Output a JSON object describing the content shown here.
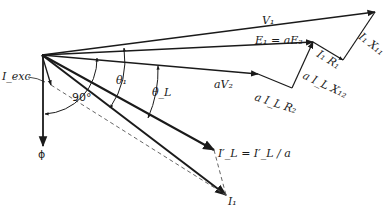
{
  "diagram": {
    "type": "phasor-diagram",
    "labels": {
      "v1": "V₁",
      "e1": "E₁ = aE₂",
      "av2": "aV₂",
      "i1r1": "I₁ R₁",
      "i1x1": "I₁ X₁₁",
      "ailr2": "a I_L R₂",
      "ailx2": "a I_L X₁₂",
      "theta1": "θ₁",
      "thetaL": "θ_L",
      "iexc": "I_exc",
      "deg90": "90°",
      "phi": "ϕ",
      "ilp": "I′_L = I′_L / a",
      "i1": "I₁"
    },
    "colors": {
      "line": "#1a1a1a",
      "dashed": "#555555",
      "background": "#ffffff"
    }
  }
}
